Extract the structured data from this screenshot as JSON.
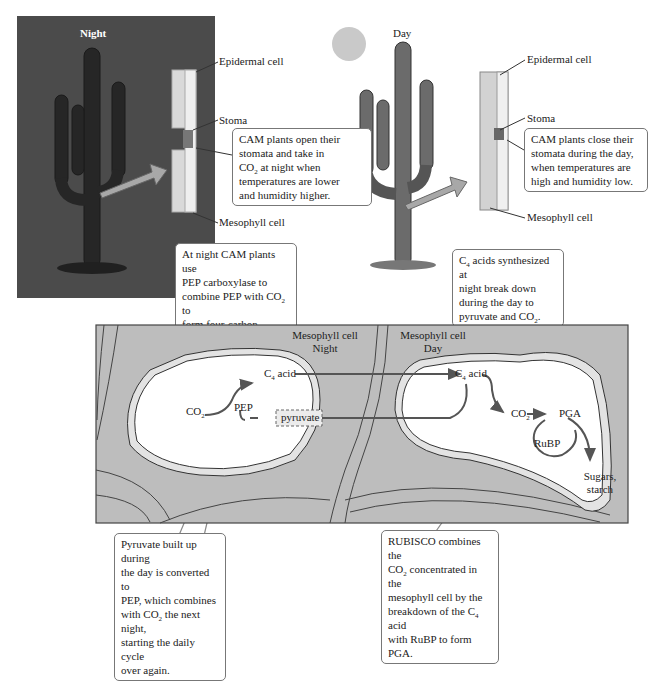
{
  "colors": {
    "night_background": "#4b4b4b",
    "day_background": "#f4f4f4",
    "moon": "#e8e8e8",
    "sun": "#c9c9c9",
    "tissue_fill": "#bdbdbd",
    "vein_fill": "#a8a8a8",
    "cell_interior": "#ffffff",
    "arrow": "#555555",
    "callout_border": "#777777"
  },
  "night_panel": {
    "title": "Night",
    "icon": "moon-icon",
    "labels": {
      "epidermal": "Epidermal cell",
      "stoma": "Stoma",
      "mesophyll": "Mesophyll cell"
    },
    "callout": {
      "line1": "CAM plants open their",
      "line2": "stomata and take in",
      "line3_pre": "CO",
      "line3_sub": "2",
      "line3_post": " at night when",
      "line4": "temperatures are lower",
      "line5": "and humidity higher."
    }
  },
  "day_panel": {
    "title": "Day",
    "icon": "sun-icon",
    "labels": {
      "epidermal": "Epidermal cell",
      "stoma": "Stoma",
      "mesophyll": "Mesophyll cell"
    },
    "callout": {
      "line1": "CAM plants close their",
      "line2": "stomata during the day,",
      "line3": "when temperatures are",
      "line4": "high and humidity low."
    }
  },
  "callouts": {
    "pep_carboxylase": {
      "line1": "At night CAM plants use",
      "line2": "PEP carboxylase to",
      "line3_pre": "combine PEP with CO",
      "line3_sub": "2",
      "line3_post": " to",
      "line4": "form four-carbon organic",
      "line5": "acids."
    },
    "c4_breakdown": {
      "line1_pre": "C",
      "line1_sub": "4",
      "line1_post": " acids synthesized at",
      "line2": "night break down",
      "line3": "during the day to",
      "line4_pre": "pyruvate and CO",
      "line4_sub": "2",
      "line4_post": "."
    },
    "pyruvate_cycle": {
      "line1": "Pyruvate built up during",
      "line2": "the day is converted to",
      "line3": "PEP, which combines",
      "line4_pre": "with CO",
      "line4_sub": "2",
      "line4_post": " the next night,",
      "line5": "starting the daily cycle",
      "line6": "over again."
    },
    "rubisco": {
      "line1": "RUBISCO combines the",
      "line2_pre": "CO",
      "line2_sub": "2",
      "line2_post": " concentrated in the",
      "line3": "mesophyll cell by the",
      "line4_pre": "breakdown of the C",
      "line4_sub": "4",
      "line4_post": " acid",
      "line5": "with RuBP to form PGA."
    }
  },
  "mesophyll_diagram": {
    "night_cell": {
      "title_line1": "Mesophyll cell",
      "title_line2": "Night",
      "co2_main": "CO",
      "co2_sub": "2",
      "pep": "PEP",
      "c4_main": "C",
      "c4_sub": "4",
      "c4_post": " acid",
      "pyruvate": "pyruvate"
    },
    "day_cell": {
      "title_line1": "Mesophyll cell",
      "title_line2": "Day",
      "c4_main": "C",
      "c4_sub": "4",
      "c4_post": " acid",
      "co2_main": "CO",
      "co2_sub": "2",
      "pga": "PGA",
      "rubp": "RuBP",
      "sugars_line1": "Sugars,",
      "sugars_line2": "starch"
    }
  }
}
